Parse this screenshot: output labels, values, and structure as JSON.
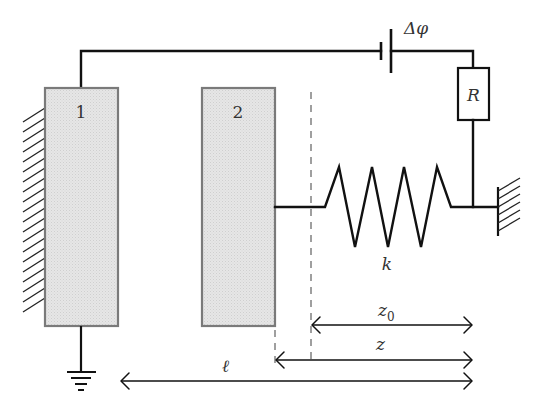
{
  "figure": {
    "colors": {
      "plate_fill": "#e3e3e3",
      "plate_stroke": "#7a7a7a",
      "wire": "#111111",
      "dashed": "#888888",
      "background": "#ffffff"
    }
  },
  "plates": [
    {
      "id": "1",
      "label": "1",
      "fixed": true
    },
    {
      "id": "2",
      "label": "2",
      "fixed": false
    }
  ],
  "circuit": {
    "battery_label": "Δφ",
    "resistor_label": "R",
    "ground": true
  },
  "spring": {
    "label": "k",
    "coils": 4
  },
  "dimensions": [
    {
      "id": "z0",
      "label": "z",
      "subscript": "0",
      "from": "equilibrium-line",
      "to": "wall"
    },
    {
      "id": "z",
      "label": "z",
      "subscript": "",
      "from": "plate-2-face",
      "to": "wall"
    },
    {
      "id": "l",
      "label": "ℓ",
      "subscript": "",
      "from": "plate-1-face",
      "to": "wall"
    }
  ]
}
